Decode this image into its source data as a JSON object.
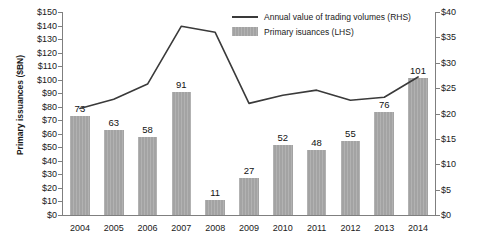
{
  "chart_data": {
    "type": "bar",
    "title": "",
    "subtitle": "",
    "categories": [
      "2004",
      "2005",
      "2006",
      "2007",
      "2008",
      "2009",
      "2010",
      "2011",
      "2012",
      "2013",
      "2014"
    ],
    "xlabel": "",
    "grid": false,
    "legend_position": "top-right",
    "series": [
      {
        "name": "Primary isuances (LHS)",
        "type": "bar",
        "axis": "left",
        "unit": "$BN",
        "color": "#a3a3a3",
        "values": [
          73,
          63,
          58,
          91,
          11,
          27,
          52,
          48,
          55,
          76,
          101
        ],
        "data_labels": [
          "73",
          "63",
          "58",
          "91",
          "11",
          "27",
          "52",
          "48",
          "55",
          "76",
          "101"
        ]
      },
      {
        "name": "Annual value of trading volumes (RHS)",
        "type": "line",
        "axis": "right",
        "unit": "$TN",
        "color": "#3a3a3a",
        "values": [
          21.0,
          22.8,
          25.8,
          37.2,
          36.0,
          22.0,
          23.6,
          24.6,
          22.6,
          23.2,
          27.2
        ]
      }
    ],
    "y_left": {
      "label": "Primary issuances ($BN)",
      "min": 0,
      "max": 150,
      "step": 10,
      "ticks": [
        "$0",
        "$10",
        "$20",
        "$30",
        "$40",
        "$50",
        "$60",
        "$70",
        "$80",
        "$90",
        "$100",
        "$110",
        "$120",
        "$130",
        "$140",
        "$150"
      ],
      "tick_values": [
        0,
        10,
        20,
        30,
        40,
        50,
        60,
        70,
        80,
        90,
        100,
        110,
        120,
        130,
        140,
        150
      ]
    },
    "y_right": {
      "label": "Annual value of trading volume ($TN)",
      "min": 0,
      "max": 40,
      "step": 5,
      "ticks": [
        "$0",
        "$5",
        "$10",
        "$15",
        "$20",
        "$25",
        "$30",
        "$35",
        "$40"
      ],
      "tick_values": [
        0,
        5,
        10,
        15,
        20,
        25,
        30,
        35,
        40
      ]
    },
    "legend": [
      {
        "key": "line",
        "label": "Annual value of trading volumes (RHS)"
      },
      {
        "key": "bar",
        "label": "Primary isuances (LHS)"
      }
    ]
  }
}
